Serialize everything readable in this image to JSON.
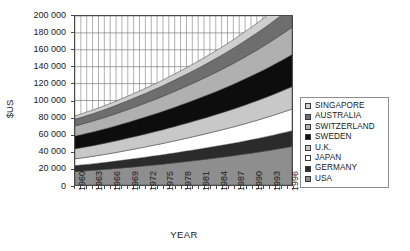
{
  "chart_data": {
    "type": "area",
    "title": "",
    "xlabel": "YEAR",
    "ylabel": "$US",
    "stacked": true,
    "grid": true,
    "legend_position": "right",
    "ylim": [
      0,
      200000
    ],
    "ytick_step": 20000,
    "ytick_labels": [
      "200 000",
      "180 000",
      "160 000",
      "140 000",
      "120 000",
      "100 000",
      "80 000",
      "60 000",
      "40 000",
      "20 000",
      "0"
    ],
    "ytick_values": [
      200000,
      180000,
      160000,
      140000,
      120000,
      100000,
      80000,
      60000,
      40000,
      20000,
      0
    ],
    "xlim": [
      1960,
      1997
    ],
    "x": [
      1960,
      1961,
      1962,
      1963,
      1964,
      1965,
      1966,
      1967,
      1968,
      1969,
      1970,
      1971,
      1972,
      1973,
      1974,
      1975,
      1976,
      1977,
      1978,
      1979,
      1980,
      1981,
      1982,
      1983,
      1984,
      1985,
      1986,
      1987,
      1988,
      1989,
      1990,
      1991,
      1992,
      1993,
      1994,
      1995,
      1996,
      1997
    ],
    "xtick_labels": [
      "1960",
      "1963",
      "1966",
      "1969",
      "1972",
      "1975",
      "1978",
      "1981",
      "1984",
      "1987",
      "1990",
      "1993",
      "1996"
    ],
    "xtick_values": [
      1960,
      1963,
      1966,
      1969,
      1972,
      1975,
      1978,
      1981,
      1984,
      1987,
      1990,
      1993,
      1996
    ],
    "xtick_label_step": 3,
    "stack_order_bottom_to_top": [
      "USA",
      "GERMANY",
      "JAPAN",
      "U.K.",
      "SWEDEN",
      "SWITZERLAND",
      "AUSTRALIA",
      "SINGAPORE"
    ],
    "series": [
      {
        "name": "USA",
        "color": "#8e8e8e",
        "values": [
          16000,
          16400,
          16900,
          17400,
          17900,
          18500,
          19000,
          19600,
          20200,
          20800,
          21400,
          22000,
          22700,
          23400,
          24000,
          24700,
          25500,
          26200,
          27000,
          27800,
          28600,
          29400,
          30200,
          31100,
          32000,
          32900,
          33800,
          34700,
          35700,
          36700,
          37700,
          38700,
          39800,
          40900,
          42000,
          43200,
          44400,
          45600
        ]
      },
      {
        "name": "GERMANY",
        "color": "#2b2b2b",
        "values": [
          7000,
          7200,
          7400,
          7600,
          7900,
          8100,
          8400,
          8700,
          9000,
          9300,
          9600,
          9900,
          10200,
          10500,
          10800,
          11100,
          11400,
          11700,
          12000,
          12300,
          12600,
          12900,
          13200,
          13500,
          13800,
          14100,
          14400,
          14700,
          15000,
          15300,
          15700,
          16100,
          16500,
          16900,
          17300,
          17700,
          18100,
          18500
        ]
      },
      {
        "name": "JAPAN",
        "color": "#ffffff",
        "values": [
          8000,
          8300,
          8600,
          8900,
          9200,
          9500,
          9900,
          10200,
          10600,
          11000,
          11400,
          11800,
          12200,
          12600,
          13000,
          13400,
          13900,
          14300,
          14800,
          15200,
          15700,
          16200,
          16700,
          17200,
          17700,
          18200,
          18800,
          19300,
          19900,
          20500,
          21100,
          21700,
          22300,
          22900,
          23600,
          24300,
          25000,
          25700
        ]
      },
      {
        "name": "U.K.",
        "color": "#c8c8c8",
        "values": [
          12000,
          12200,
          12500,
          12700,
          13000,
          13200,
          13500,
          13800,
          14100,
          14400,
          14700,
          15000,
          15300,
          15600,
          16000,
          16300,
          16700,
          17000,
          17400,
          17800,
          18200,
          18600,
          19000,
          19400,
          19800,
          20300,
          20700,
          21200,
          21700,
          22200,
          22700,
          23200,
          23700,
          24200,
          24800,
          25400,
          26000,
          26600
        ]
      },
      {
        "name": "SWEDEN",
        "color": "#0d0d0d",
        "values": [
          15000,
          15300,
          15700,
          16100,
          16500,
          16900,
          17300,
          17700,
          18200,
          18600,
          19100,
          19600,
          20100,
          20600,
          21100,
          21700,
          22200,
          22800,
          23400,
          24000,
          24600,
          25200,
          25900,
          26500,
          27200,
          27900,
          28600,
          29400,
          30100,
          30900,
          31700,
          32500,
          33300,
          34200,
          35100,
          36000,
          36900,
          37900
        ]
      },
      {
        "name": "SWITZERLAND",
        "color": "#b0b0b0",
        "values": [
          12000,
          12300,
          12600,
          12900,
          13300,
          13600,
          14000,
          14400,
          14800,
          15200,
          15600,
          16000,
          16400,
          16900,
          17300,
          17800,
          18300,
          18800,
          19300,
          19800,
          20400,
          20900,
          21500,
          22100,
          22700,
          23300,
          24000,
          24600,
          25300,
          26000,
          26700,
          27400,
          28200,
          29000,
          29800,
          30600,
          31400,
          32300
        ]
      },
      {
        "name": "AUSTRALIA",
        "color": "#6e6e6e",
        "values": [
          8000,
          8200,
          8500,
          8700,
          9000,
          9300,
          9600,
          9900,
          10200,
          10500,
          10800,
          11200,
          11500,
          11900,
          12200,
          12600,
          13000,
          13400,
          13800,
          14200,
          14600,
          15100,
          15500,
          16000,
          16500,
          17000,
          17500,
          18000,
          18600,
          19100,
          19700,
          20300,
          20900,
          21500,
          22200,
          22800,
          23500,
          24200
        ]
      },
      {
        "name": "SINGAPORE",
        "color": "#cfcfcf",
        "values": [
          4000,
          4100,
          4200,
          4400,
          4500,
          4700,
          4800,
          5000,
          5200,
          5400,
          5600,
          5800,
          6000,
          6200,
          6400,
          6700,
          6900,
          7100,
          7400,
          7700,
          7900,
          8200,
          8500,
          8800,
          9100,
          9400,
          9700,
          10100,
          10400,
          10800,
          11100,
          11500,
          11900,
          12300,
          12700,
          13200,
          13600,
          14100
        ]
      }
    ]
  },
  "axes": {
    "y_title": "$US",
    "x_title": "YEAR"
  },
  "legend": {
    "items": [
      {
        "label": "SINGAPORE",
        "color": "#cfcfcf"
      },
      {
        "label": "AUSTRALIA",
        "color": "#6e6e6e"
      },
      {
        "label": "SWITZERLAND",
        "color": "#b0b0b0"
      },
      {
        "label": "SWEDEN",
        "color": "#0d0d0d"
      },
      {
        "label": "U.K.",
        "color": "#c8c8c8"
      },
      {
        "label": "JAPAN",
        "color": "#ffffff"
      },
      {
        "label": "GERMANY",
        "color": "#2b2b2b"
      },
      {
        "label": "USA",
        "color": "#8e8e8e"
      }
    ]
  },
  "style": {
    "grid_color": "#7a7a7a",
    "axis_color": "#4a4a4a",
    "plot_bg": "#ffffff"
  }
}
